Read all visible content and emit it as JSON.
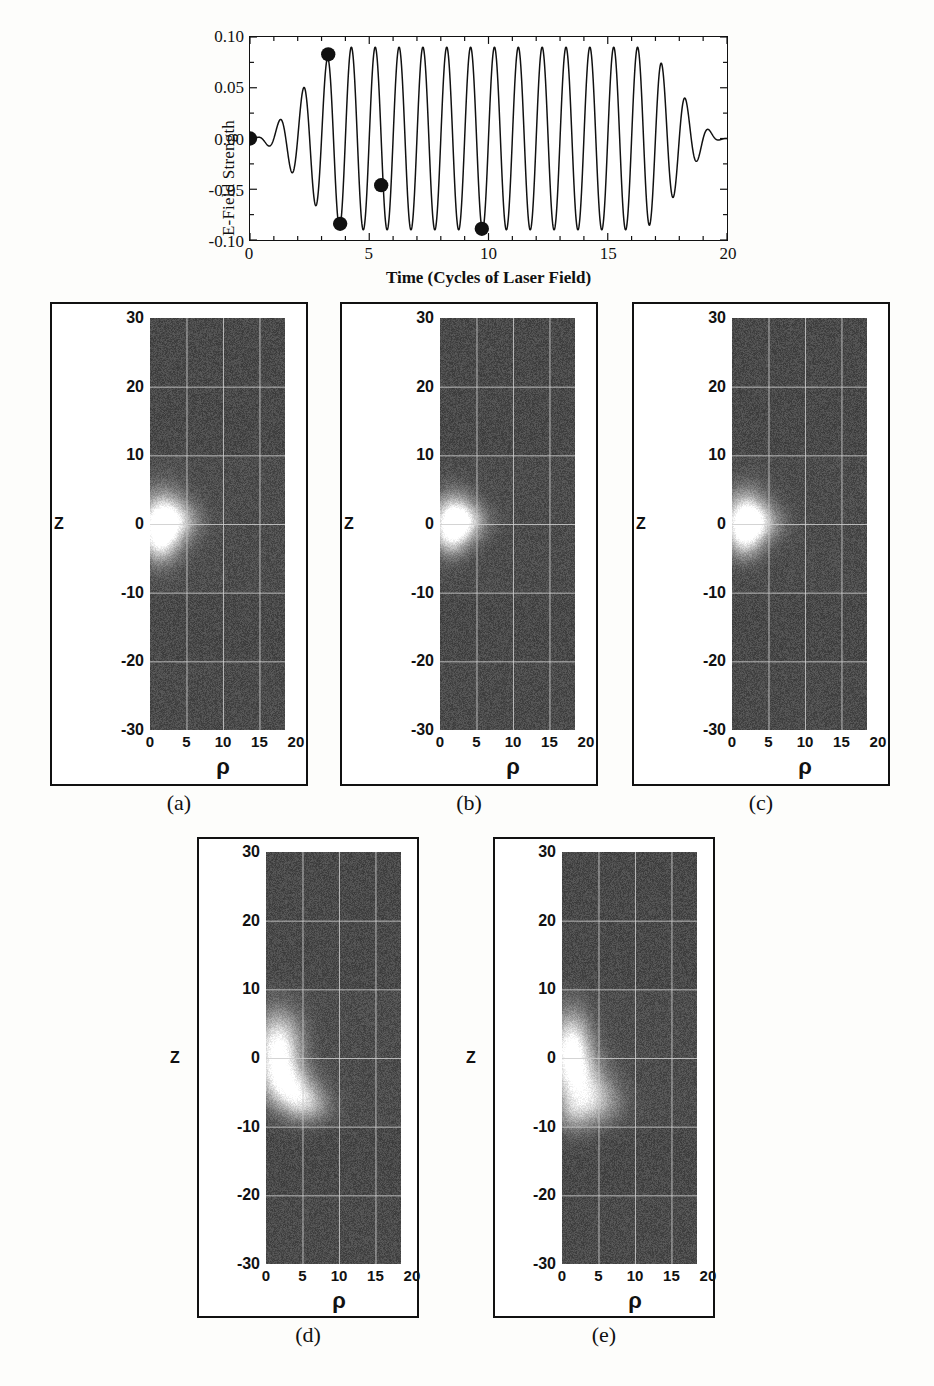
{
  "figure": {
    "background_color": "#fdfdfb"
  },
  "wave_chart": {
    "ylabel": "E-Field Strength",
    "xlabel": "Time (Cycles of Laser Field)",
    "y_ticks": [
      "0.10",
      "0.05",
      "0.00",
      "-0.05",
      "-0.10"
    ],
    "y_tick_values": [
      0.1,
      0.05,
      0.0,
      -0.05,
      -0.1
    ],
    "x_ticks": [
      "0",
      "5",
      "10",
      "15",
      "20"
    ],
    "x_tick_values": [
      0,
      5,
      10,
      15,
      20
    ],
    "line_color": "#111111",
    "marker_color": "#111111"
  },
  "chart_data": {
    "type": "line",
    "title": "",
    "xlabel": "Time (Cycles of Laser Field)",
    "ylabel": "E-Field Strength",
    "xlim": [
      0,
      20
    ],
    "ylim": [
      -0.1,
      0.1
    ],
    "grid": false,
    "legend": "none",
    "cycles_per_unit": 1,
    "peak_amplitude": 0.09,
    "envelope": {
      "ramp_up_end": 4.2,
      "plateau_end": 16.2,
      "ramp_down_end": 20.0
    },
    "markers": [
      {
        "label": "a",
        "x": 0.0,
        "y": 0.0
      },
      {
        "label": "b",
        "x": 3.28,
        "y": 0.083
      },
      {
        "label": "c",
        "x": 3.78,
        "y": -0.084
      },
      {
        "label": "d",
        "x": 5.5,
        "y": -0.046
      },
      {
        "label": "e",
        "x": 9.72,
        "y": -0.089
      }
    ]
  },
  "panels": [
    {
      "caption": "(a)",
      "z_axis_name": "Z",
      "z_ticks": [
        "30",
        "20",
        "10",
        "0",
        "-10",
        "-20",
        "-30"
      ],
      "z_tick_values": [
        30,
        20,
        10,
        0,
        -10,
        -20,
        -30
      ],
      "rho_axis_name": "ρ",
      "rho_ticks": [
        "0",
        "5",
        "10",
        "15",
        "20"
      ],
      "rho_tick_values": [
        0,
        5,
        10,
        15,
        20
      ],
      "seed": 11,
      "blobs": [
        {
          "rho": 1.6,
          "z": 0.2,
          "rw": 3.0,
          "zh": 4.4,
          "amp": 1.0
        },
        {
          "rho": 3.6,
          "z": 0.6,
          "rw": 3.2,
          "zh": 2.6,
          "amp": 0.42
        },
        {
          "rho": 1.2,
          "z": -2.6,
          "rw": 2.0,
          "zh": 3.0,
          "amp": 0.4
        }
      ],
      "shading_rows": [
        [
          30,
          10,
          0.0
        ],
        [
          10,
          -10,
          0.05
        ],
        [
          -10,
          -20,
          0.0
        ],
        [
          -20,
          -30,
          0.02
        ]
      ]
    },
    {
      "caption": "(b)",
      "z_axis_name": "Z",
      "z_ticks": [
        "30",
        "20",
        "10",
        "0",
        "-10",
        "-20",
        "-30"
      ],
      "z_tick_values": [
        30,
        20,
        10,
        0,
        -10,
        -20,
        -30
      ],
      "rho_axis_name": "ρ",
      "rho_ticks": [
        "0",
        "5",
        "10",
        "15",
        "20"
      ],
      "rho_tick_values": [
        0,
        5,
        10,
        15,
        20
      ],
      "seed": 27,
      "blobs": [
        {
          "rho": 1.8,
          "z": 0.8,
          "rw": 2.8,
          "zh": 3.6,
          "amp": 0.92
        },
        {
          "rho": 3.4,
          "z": 0.4,
          "rw": 3.0,
          "zh": 2.4,
          "amp": 0.45
        },
        {
          "rho": 1.4,
          "z": -2.2,
          "rw": 2.2,
          "zh": 2.6,
          "amp": 0.42
        }
      ],
      "shading_rows": [
        [
          30,
          10,
          0.0
        ],
        [
          10,
          -10,
          0.04
        ],
        [
          -10,
          -20,
          0.0
        ],
        [
          -20,
          -30,
          0.02
        ]
      ]
    },
    {
      "caption": "(c)",
      "z_axis_name": "Z",
      "z_ticks": [
        "30",
        "20",
        "10",
        "0",
        "-10",
        "-20",
        "-30"
      ],
      "z_tick_values": [
        30,
        20,
        10,
        0,
        -10,
        -20,
        -30
      ],
      "rho_axis_name": "ρ",
      "rho_ticks": [
        "0",
        "5",
        "10",
        "15",
        "20"
      ],
      "rho_tick_values": [
        0,
        5,
        10,
        15,
        20
      ],
      "seed": 43,
      "blobs": [
        {
          "rho": 1.8,
          "z": 1.0,
          "rw": 2.8,
          "zh": 3.8,
          "amp": 0.95
        },
        {
          "rho": 3.6,
          "z": 0.2,
          "rw": 3.2,
          "zh": 2.6,
          "amp": 0.46
        },
        {
          "rho": 1.6,
          "z": -2.4,
          "rw": 2.2,
          "zh": 2.8,
          "amp": 0.45
        }
      ],
      "shading_rows": [
        [
          30,
          10,
          0.0
        ],
        [
          10,
          -10,
          0.04
        ],
        [
          -10,
          -20,
          0.0
        ],
        [
          -20,
          -30,
          0.02
        ]
      ]
    },
    {
      "caption": "(d)",
      "z_axis_name": "Z",
      "z_ticks": [
        "30",
        "20",
        "10",
        "0",
        "-10",
        "-20",
        "-30"
      ],
      "z_tick_values": [
        30,
        20,
        10,
        0,
        -10,
        -20,
        -30
      ],
      "rho_axis_name": "ρ",
      "rho_ticks": [
        "0",
        "5",
        "10",
        "15",
        "20"
      ],
      "rho_tick_values": [
        0,
        5,
        10,
        15,
        20
      ],
      "seed": 61,
      "blobs": [
        {
          "rho": 1.6,
          "z": 1.6,
          "rw": 3.0,
          "zh": 5.0,
          "amp": 1.0
        },
        {
          "rho": 4.0,
          "z": -5.2,
          "rw": 3.0,
          "zh": 3.0,
          "amp": 0.62
        },
        {
          "rho": 2.0,
          "z": -3.0,
          "rw": 3.2,
          "zh": 3.2,
          "amp": 0.46
        },
        {
          "rho": 6.0,
          "z": -7.0,
          "rw": 3.0,
          "zh": 2.4,
          "amp": 0.34
        }
      ],
      "shading_rows": [
        [
          30,
          10,
          0.0
        ],
        [
          10,
          -10,
          0.05
        ],
        [
          -10,
          -20,
          0.0
        ],
        [
          -20,
          -30,
          0.02
        ]
      ]
    },
    {
      "caption": "(e)",
      "z_axis_name": "Z",
      "z_ticks": [
        "30",
        "20",
        "10",
        "0",
        "-10",
        "-20",
        "-30"
      ],
      "z_tick_values": [
        30,
        20,
        10,
        0,
        -10,
        -20,
        -30
      ],
      "rho_axis_name": "ρ",
      "rho_ticks": [
        "0",
        "5",
        "10",
        "15",
        "20"
      ],
      "rho_tick_values": [
        0,
        5,
        10,
        15,
        20
      ],
      "seed": 83,
      "blobs": [
        {
          "rho": 1.2,
          "z": 1.4,
          "rw": 2.6,
          "zh": 5.2,
          "amp": 1.0
        },
        {
          "rho": 2.6,
          "z": -3.4,
          "rw": 3.4,
          "zh": 4.2,
          "amp": 0.55
        },
        {
          "rho": 4.6,
          "z": -6.4,
          "rw": 3.4,
          "zh": 3.2,
          "amp": 0.44
        },
        {
          "rho": 1.4,
          "z": -8.0,
          "rw": 2.4,
          "zh": 3.0,
          "amp": 0.32
        }
      ],
      "shading_rows": [
        [
          30,
          10,
          0.0
        ],
        [
          10,
          -10,
          0.05
        ],
        [
          -10,
          -20,
          0.0
        ],
        [
          -20,
          -30,
          0.02
        ]
      ]
    }
  ],
  "colors": {
    "ink": "#111111",
    "density_base": "#4a4a4a",
    "density_grid": "#b9b9b9",
    "density_bright": "#ffffff",
    "paper": "#fdfdfb"
  }
}
